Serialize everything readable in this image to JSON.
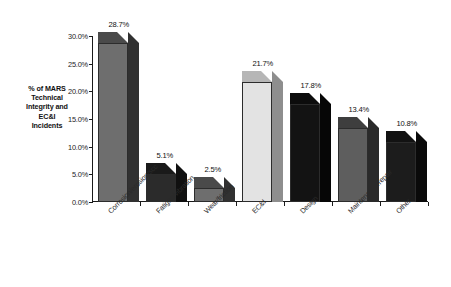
{
  "chart_data": {
    "type": "bar",
    "title": "",
    "subtitle": "",
    "xlabel": "",
    "ylabel": "% of MARS Technical Integrity and EC&I Incidents",
    "ylabel_lines": [
      "% of MARS",
      "Technical",
      "Integrity and",
      "EC&I",
      "Incidents"
    ],
    "categories": [
      "Corrosion/erosion/scc",
      "Fatigue/vibration",
      "Wear/friction",
      "EC&I",
      "Design",
      "Maintenance/repair",
      "Other"
    ],
    "values": [
      28.7,
      5.1,
      2.5,
      21.7,
      17.8,
      13.4,
      10.8
    ],
    "data_labels": [
      "28.7%",
      "5.1%",
      "2.5%",
      "21.7%",
      "17.8%",
      "13.4%",
      "10.8%"
    ],
    "ylim": [
      0,
      30
    ],
    "ytick_values": [
      0,
      5,
      10,
      15,
      20,
      25,
      30
    ],
    "ytick_labels": [
      "0.0%",
      "5.0%",
      "10.0%",
      "15.0%",
      "20.0%",
      "25.0%",
      "30.0%"
    ],
    "grid": false,
    "legend": "none",
    "style": "3d-column",
    "bar_colors": [
      "#6e6e6e",
      "#2b2b2b",
      "#6e6e6e",
      "#e3e3e3",
      "#131313",
      "#5e5e5e",
      "#1c1c1c"
    ],
    "bar_top_colors": [
      "#4a4a4a",
      "#1a1a1a",
      "#4a4a4a",
      "#b6b6b6",
      "#0c0c0c",
      "#3e3e3e",
      "#121212"
    ],
    "bar_side_colors": [
      "#313131",
      "#101010",
      "#313131",
      "#8e8e8e",
      "#060606",
      "#2a2a2a",
      "#0a0a0a"
    ]
  },
  "colors": {
    "background": "#ffffff",
    "axis": "#1a1a1a",
    "text": "#111111"
  }
}
